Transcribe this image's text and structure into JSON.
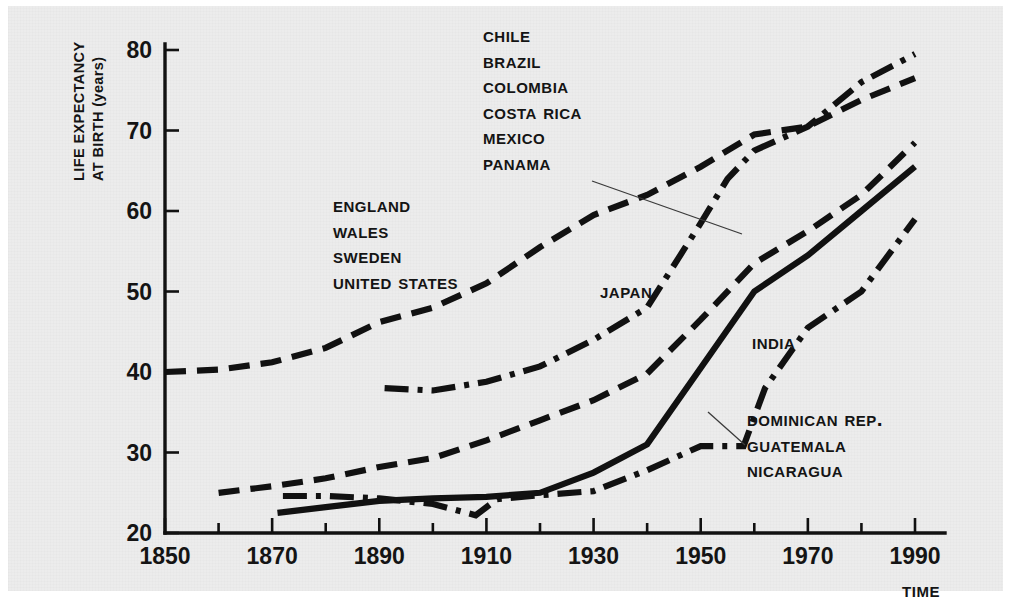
{
  "figure": {
    "background_color": "#ececec",
    "ink_color": "#111111"
  },
  "chart_data": {
    "type": "line",
    "title": "",
    "xlabel": "TIME",
    "ylabel": "LIFE EXPECTANCY AT BIRTH (years)",
    "xlim": [
      1850,
      1995
    ],
    "ylim": [
      20,
      82
    ],
    "xticks": [
      "1850",
      "1870",
      "1890",
      "1910",
      "1930",
      "1950",
      "1970",
      "1990"
    ],
    "xtick_values": [
      1850,
      1870,
      1890,
      1910,
      1930,
      1950,
      1970,
      1990
    ],
    "yticks": [
      "20",
      "30",
      "40",
      "50",
      "60",
      "70",
      "80"
    ],
    "ytick_values": [
      20,
      30,
      40,
      50,
      60,
      70,
      80
    ],
    "minor_xtick_interval": 10,
    "grid": false,
    "legend": "inline-labels",
    "series": [
      {
        "name": "England, Wales, Sweden, United States",
        "label_lines": [
          "England",
          "Wales",
          "Sweden",
          "United States"
        ],
        "line_style": "long-dash",
        "x": [
          1850,
          1860,
          1870,
          1880,
          1890,
          1900,
          1910,
          1920,
          1930,
          1940,
          1950,
          1960,
          1970,
          1980,
          1990
        ],
        "y": [
          40.0,
          40.3,
          41.2,
          43.0,
          46.2,
          48.0,
          51.0,
          55.5,
          59.5,
          62.0,
          65.5,
          69.5,
          70.5,
          73.8,
          76.5
        ]
      },
      {
        "name": "Chile, Brazil, Colombia, Costa Rica, Mexico, Panama",
        "label_lines": [
          "Chile",
          "Brazil",
          "Colombia",
          "Costa Rica",
          "Mexico",
          "Panama"
        ],
        "line_style": "long-dash",
        "x": [
          1860,
          1870,
          1880,
          1890,
          1900,
          1910,
          1920,
          1930,
          1940,
          1950,
          1960,
          1970,
          1980,
          1990
        ],
        "y": [
          25.0,
          25.8,
          26.8,
          28.2,
          29.3,
          31.5,
          34.0,
          36.5,
          39.8,
          46.5,
          53.5,
          57.5,
          62.0,
          68.5
        ]
      },
      {
        "name": "Japan",
        "label_lines": [
          "Japan"
        ],
        "line_style": "dash-dot",
        "x": [
          1891,
          1900,
          1910,
          1920,
          1930,
          1940,
          1950,
          1955,
          1960,
          1970,
          1980,
          1990
        ],
        "y": [
          38.0,
          37.7,
          38.8,
          40.7,
          44.0,
          48.0,
          58.5,
          64.0,
          67.5,
          70.5,
          76.0,
          79.5
        ]
      },
      {
        "name": "India",
        "label_lines": [
          "India"
        ],
        "line_style": "dash-dot",
        "x": [
          1872,
          1880,
          1890,
          1900,
          1908,
          1912,
          1920,
          1930,
          1940,
          1950,
          1958,
          1962,
          1970,
          1980,
          1990
        ],
        "y": [
          24.6,
          24.6,
          24.3,
          23.6,
          22.2,
          24.2,
          24.7,
          25.2,
          27.8,
          30.8,
          30.8,
          38.0,
          45.5,
          50.0,
          59.0
        ]
      },
      {
        "name": "Dominican Rep., Guatemala, Nicaragua",
        "label_lines": [
          "Dominican Rep.",
          "Guatemala",
          "Nicaragua"
        ],
        "line_style": "solid",
        "x": [
          1871,
          1880,
          1890,
          1900,
          1910,
          1920,
          1930,
          1940,
          1950,
          1960,
          1970,
          1980,
          1990
        ],
        "y": [
          22.5,
          23.2,
          24.0,
          24.3,
          24.5,
          25.0,
          27.5,
          31.0,
          40.5,
          50.0,
          54.5,
          60.0,
          65.5
        ]
      }
    ]
  },
  "annotations": {
    "group_chile": {
      "lines": [
        "Chile",
        "Brazil",
        "Colombia",
        "Costa Rica",
        "Mexico",
        "Panama"
      ],
      "x": 483,
      "y": 22,
      "leader": {
        "x1": 592,
        "y1": 181,
        "x2": 742,
        "y2": 234
      }
    },
    "group_england": {
      "lines": [
        "England",
        "Wales",
        "Sweden",
        "United States"
      ],
      "x": 333,
      "y": 192
    },
    "label_japan": {
      "text": "Japan",
      "x": 600,
      "y": 278
    },
    "label_india": {
      "text": "India",
      "x": 752,
      "y": 329
    },
    "group_dominican": {
      "lines": [
        "Dominican Rep.",
        "Guatemala",
        "Nicaragua"
      ],
      "x": 747,
      "y": 406,
      "leader": {
        "x1": 708,
        "y1": 412,
        "x2": 745,
        "y2": 445
      }
    }
  },
  "axis": {
    "y_title_line1": "LIFE EXPECTANCY",
    "y_title_line2": "AT BIRTH (years)",
    "x_title": "TIME"
  }
}
